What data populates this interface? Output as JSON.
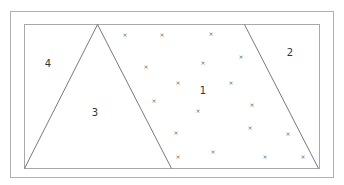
{
  "diagram": {
    "type": "partitioned-rectangle",
    "colors": {
      "background": "#ffffff",
      "outer_border": "#b0b0b0",
      "inner_border": "#a8a8a8",
      "partition_lines": "#6a6a6a",
      "labels": "#333333",
      "marks": "#666666"
    },
    "outer_rect": {
      "x": 10,
      "y": 11,
      "width": 323,
      "height": 166
    },
    "inner_rect": {
      "x": 24,
      "y": 24,
      "width": 295,
      "height": 144
    },
    "partition_lines": [
      {
        "name": "triangle-left-edge",
        "x1": 97,
        "y1": 24,
        "x2": 24,
        "y2": 168
      },
      {
        "name": "triangle-right-edge",
        "x1": 97,
        "y1": 24,
        "x2": 171,
        "y2": 168
      },
      {
        "name": "right-slant-line",
        "x1": 244,
        "y1": 24,
        "x2": 318,
        "y2": 168
      }
    ],
    "regions": [
      {
        "id": "1",
        "label": "1",
        "x": 203,
        "y": 91
      },
      {
        "id": "2",
        "label": "2",
        "x": 290,
        "y": 53
      },
      {
        "id": "3",
        "label": "3",
        "x": 95,
        "y": 113
      },
      {
        "id": "4",
        "label": "4",
        "x": 48,
        "y": 64
      }
    ],
    "mark_glyph": "×",
    "marks": [
      {
        "x": 125,
        "y": 35
      },
      {
        "x": 162,
        "y": 35
      },
      {
        "x": 211,
        "y": 34
      },
      {
        "x": 146,
        "y": 67
      },
      {
        "x": 241,
        "y": 57
      },
      {
        "x": 203,
        "y": 63
      },
      {
        "x": 178,
        "y": 83
      },
      {
        "x": 154,
        "y": 101
      },
      {
        "x": 231,
        "y": 83
      },
      {
        "x": 198,
        "y": 111
      },
      {
        "x": 252,
        "y": 105
      },
      {
        "x": 176,
        "y": 133
      },
      {
        "x": 250,
        "y": 128
      },
      {
        "x": 288,
        "y": 134
      },
      {
        "x": 178,
        "y": 157
      },
      {
        "x": 213,
        "y": 152
      },
      {
        "x": 265,
        "y": 157
      },
      {
        "x": 303,
        "y": 157
      }
    ]
  }
}
